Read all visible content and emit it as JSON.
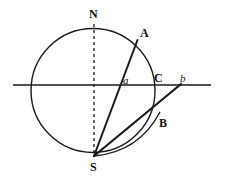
{
  "figure": {
    "type": "geometric-diagram",
    "canvas": {
      "width": 225,
      "height": 179
    },
    "colors": {
      "background": "#ffffff",
      "stroke": "#1a1a1a",
      "label": "#111111"
    },
    "circle": {
      "cx": 93,
      "cy": 90.5,
      "r": 62,
      "stroke_width": 1.4
    },
    "horizon_line": {
      "x1": 13,
      "y1": 85,
      "x2": 211,
      "y2": 85,
      "stroke_width": 1.3
    },
    "axis_dashed": {
      "x1": 94,
      "y1": 24,
      "x2": 94,
      "y2": 157,
      "dash": "3,3",
      "stroke_width": 1.3
    },
    "line_S_to_A": {
      "x1": 94,
      "y1": 156,
      "x2": 137.5,
      "y2": 40,
      "stroke_width": 2.0
    },
    "line_S_to_b": {
      "x1": 94,
      "y1": 156,
      "x2": 181,
      "y2": 84,
      "stroke_width": 2.2
    },
    "arc_S_to_B": {
      "from_x": 94,
      "from_y": 156,
      "to_x": 160,
      "to_y": 112,
      "ctrl_x": 139,
      "ctrl_y": 152,
      "stroke_width": 1.4
    },
    "points": [
      {
        "id": "N",
        "x": 94,
        "y": 24
      },
      {
        "id": "A",
        "x": 137.5,
        "y": 40
      },
      {
        "id": "a",
        "x": 123,
        "y": 85
      },
      {
        "id": "C",
        "x": 155,
        "y": 85
      },
      {
        "id": "b",
        "x": 181,
        "y": 85
      },
      {
        "id": "B",
        "x": 157,
        "y": 115
      },
      {
        "id": "S",
        "x": 94,
        "y": 157
      }
    ],
    "labels": [
      {
        "name": "label-N",
        "text": "N",
        "style": "bold",
        "x": 89,
        "y": 8
      },
      {
        "name": "label-A",
        "text": "A",
        "style": "bold",
        "x": 140,
        "y": 27
      },
      {
        "name": "label-a",
        "text": "a",
        "style": "italic",
        "x": 123,
        "y": 75
      },
      {
        "name": "label-C",
        "text": "C",
        "style": "bold",
        "x": 154,
        "y": 72
      },
      {
        "name": "label-b",
        "text": "b",
        "style": "italic",
        "x": 180,
        "y": 73
      },
      {
        "name": "label-B",
        "text": "B",
        "style": "bold",
        "x": 159,
        "y": 117
      },
      {
        "name": "label-S",
        "text": "S",
        "style": "bold",
        "x": 90,
        "y": 161
      }
    ]
  }
}
